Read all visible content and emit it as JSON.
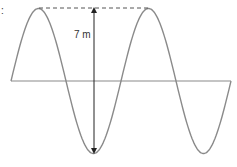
{
  "diagram": {
    "type": "sine-wave",
    "label": "7 m",
    "corner_mark": ":",
    "cycles": 2,
    "measurement": "peak-to-trough height",
    "colors": {
      "wave": "#8a8a8a",
      "axis": "#8a8a8a",
      "arrow": "#222222",
      "dashed": "#555555"
    }
  }
}
